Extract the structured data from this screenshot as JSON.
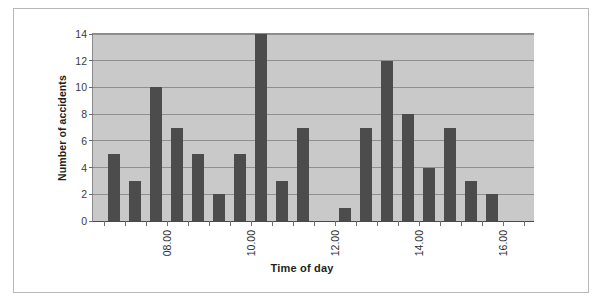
{
  "chart_data": {
    "type": "bar",
    "title": "",
    "xlabel": "Time of day",
    "ylabel": "Number of accidents",
    "ylim": [
      0,
      14
    ],
    "yticks": [
      0,
      2,
      4,
      6,
      8,
      10,
      12,
      14
    ],
    "ytick_labels": [
      "0",
      "2",
      "4",
      "6",
      "8",
      "10",
      "12",
      "14"
    ],
    "grid": true,
    "legend": "none",
    "xtick_labels": [
      "08.00",
      "10.00",
      "12.00",
      "14.00",
      "16.00"
    ],
    "x_axis_note": "half-hour intervals; labels shown every 2 hours",
    "categories": [
      "07.00",
      "07.30",
      "08.00",
      "08.30",
      "09.00",
      "09.30",
      "10.00",
      "10.30",
      "11.00",
      "11.30",
      "12.00",
      "12.30",
      "13.00",
      "13.30",
      "14.00",
      "14.30",
      "15.00",
      "15.30",
      "16.00",
      "16.30"
    ],
    "values": [
      5,
      3,
      10,
      7,
      5,
      2,
      5,
      14,
      3,
      7,
      0,
      1,
      7,
      12,
      8,
      4,
      7,
      3,
      2,
      0
    ],
    "bars": [
      {
        "index": 0,
        "label": "07.00",
        "value": 5
      },
      {
        "index": 1,
        "label": "07.30",
        "value": 3
      },
      {
        "index": 2,
        "label": "08.00",
        "value": 10
      },
      {
        "index": 3,
        "label": "08.30",
        "value": 7
      },
      {
        "index": 4,
        "label": "09.00",
        "value": 5
      },
      {
        "index": 5,
        "label": "09.30",
        "value": 2
      },
      {
        "index": 6,
        "label": "10.00",
        "value": 5
      },
      {
        "index": 7,
        "label": "10.30",
        "value": 14
      },
      {
        "index": 8,
        "label": "11.00",
        "value": 3
      },
      {
        "index": 9,
        "label": "11.30",
        "value": 7
      },
      {
        "index": 10,
        "label": "12.00",
        "value": 0
      },
      {
        "index": 11,
        "label": "12.30",
        "value": 1
      },
      {
        "index": 12,
        "label": "13.00",
        "value": 7
      },
      {
        "index": 13,
        "label": "13.30",
        "value": 12
      },
      {
        "index": 14,
        "label": "14.00",
        "value": 8
      },
      {
        "index": 15,
        "label": "14.30",
        "value": 4
      },
      {
        "index": 16,
        "label": "15.00",
        "value": 7
      },
      {
        "index": 17,
        "label": "15.30",
        "value": 3
      },
      {
        "index": 18,
        "label": "16.00",
        "value": 2
      },
      {
        "index": 19,
        "label": "16.30",
        "value": 0
      }
    ],
    "colors": {
      "bar": "#4c4c4c",
      "plot_background": "#c9c9c9",
      "figure_background": "#ffffff",
      "gridline": "#8f8f8f",
      "axis": "#6e6e6e",
      "text": "#2e2e2e",
      "border": "#b8b8b8"
    }
  }
}
